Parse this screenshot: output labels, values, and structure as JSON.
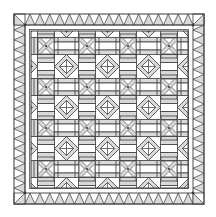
{
  "diagram": {
    "title": "Quilt pattern",
    "type": "quilt-layout",
    "colors": {
      "background": "#ffffff",
      "line": "#3a3a3a",
      "fill_light": "#d9d9d9",
      "fill_mid": "#c4c4c4"
    },
    "outer": {
      "x0": 14,
      "y0": 14,
      "x1": 204,
      "y1": 204
    },
    "border": {
      "band_width": 11,
      "triangle_pitch": 10.0,
      "triangles_per_side": 17,
      "corner_squares": 4,
      "gap_inner_line": 29.5
    },
    "field": {
      "x0": 31,
      "y0": 31,
      "x1": 188,
      "y1": 188,
      "grid_origin": 25.5,
      "period": 41,
      "x_blocks": {
        "rows": 4,
        "cols": 4,
        "half_size": 8
      },
      "diamond_blocks": {
        "half_size": 12,
        "inner_half": 7
      },
      "rail_strips": 3
    },
    "blocks": {
      "x_block_label": "X block",
      "diamond_block_label": "Octagon / diamond block",
      "rail_label": "Three-strip rail"
    }
  }
}
